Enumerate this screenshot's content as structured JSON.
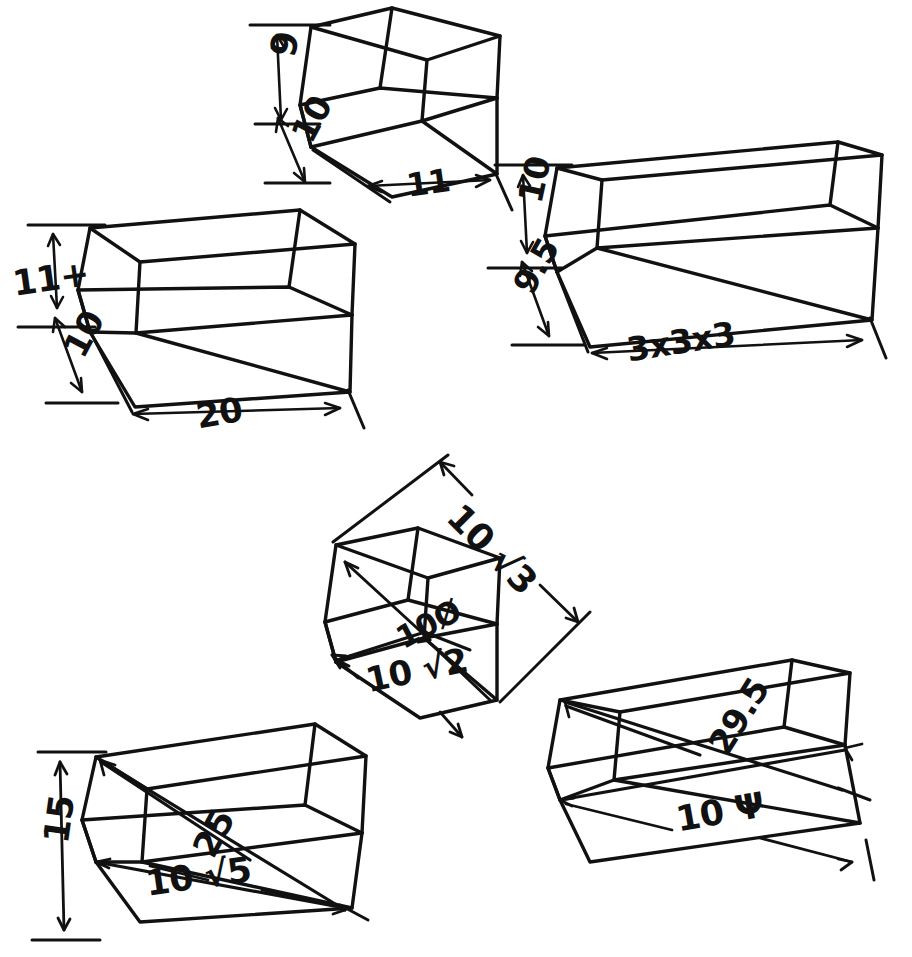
{
  "figure": {
    "kind": "hand-drawn-isometric-wireframe-boxes",
    "background_color": "#ffffff",
    "ink_color": "#111111",
    "box_count": 6
  },
  "boxes": [
    {
      "id": "top-center-box",
      "name": "box-9-10-11",
      "labels": [
        {
          "key": "height",
          "text": "9",
          "rotation": -78
        },
        {
          "key": "depth",
          "text": "10",
          "rotation": -62
        },
        {
          "key": "width",
          "text": "11",
          "rotation": -8
        }
      ]
    },
    {
      "id": "left-box",
      "name": "box-11plus-10-20",
      "labels": [
        {
          "key": "height",
          "text": "11+",
          "rotation": -8
        },
        {
          "key": "depth",
          "text": "10",
          "rotation": -62
        },
        {
          "key": "width",
          "text": "20",
          "rotation": -10
        }
      ]
    },
    {
      "id": "right-box",
      "name": "box-10-9p5-3x3x3",
      "labels": [
        {
          "key": "height",
          "text": "10",
          "rotation": -78
        },
        {
          "key": "depth",
          "text": "9.5",
          "rotation": -60
        },
        {
          "key": "width",
          "text": "3x3x3",
          "rotation": -9
        }
      ]
    },
    {
      "id": "center-cube",
      "name": "cube-diagonals",
      "labels": [
        {
          "key": "space-diagonal",
          "text": "10 √3",
          "rotation": 45
        },
        {
          "key": "face-diagonal",
          "text": "10 √2",
          "rotation": -12
        },
        {
          "key": "edge",
          "text": "10Ø",
          "rotation": -28
        }
      ]
    },
    {
      "id": "bottom-left-box",
      "name": "box-15-25-10root5",
      "labels": [
        {
          "key": "height",
          "text": "15",
          "rotation": -82
        },
        {
          "key": "space-diagonal",
          "text": "25",
          "rotation": -62
        },
        {
          "key": "face-diagonal",
          "text": "10 √5",
          "rotation": -8
        }
      ]
    },
    {
      "id": "bottom-right-box",
      "name": "box-29p5-10psi",
      "labels": [
        {
          "key": "space-diagonal",
          "text": "29.5",
          "rotation": -58
        },
        {
          "key": "face-diagonal",
          "text": "10 Ψ",
          "rotation": -10
        }
      ]
    }
  ]
}
